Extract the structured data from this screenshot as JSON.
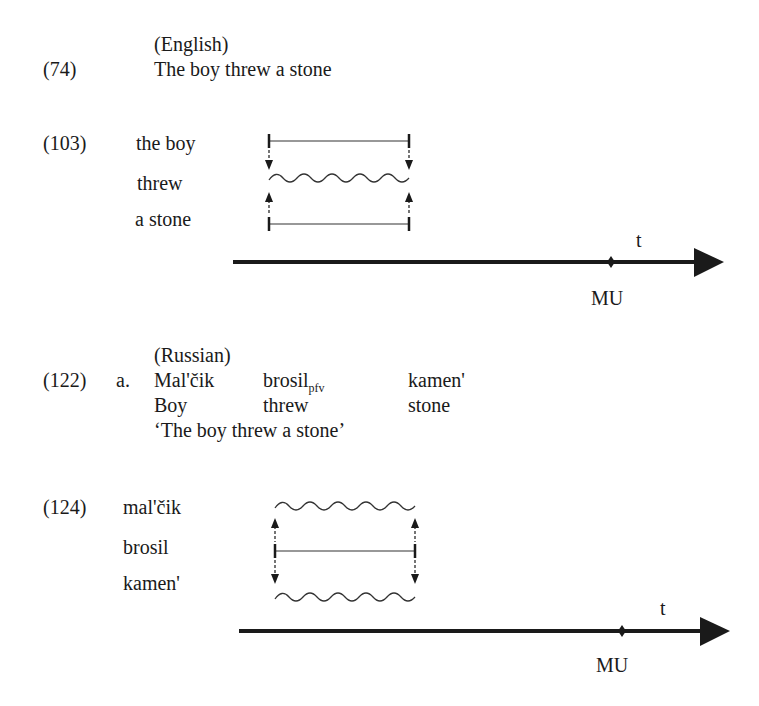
{
  "english": {
    "language": "(English)",
    "example_number": "(74)",
    "sentence": "The boy threw a stone",
    "diagram": {
      "number": "(103)",
      "rows": [
        "the boy",
        "threw",
        "a stone"
      ],
      "row_shapes": [
        "bounded",
        "wavy",
        "bounded"
      ],
      "arrows": "outer rows point toward middle row",
      "axis_label": "t",
      "reference_point": "MU"
    }
  },
  "russian": {
    "language": "(Russian)",
    "example_number": "(122)",
    "sub_label": "a.",
    "gloss": {
      "words": [
        "Mal'čik",
        "brosil",
        "kamen'"
      ],
      "brosil_subscript": "pfv",
      "glosses": [
        "Boy",
        "threw",
        "stone"
      ],
      "translation": "‘The boy threw a stone’"
    },
    "diagram": {
      "number": "(124)",
      "rows": [
        "mal'čik",
        "brosil",
        "kamen'"
      ],
      "row_shapes": [
        "wavy",
        "bounded",
        "wavy"
      ],
      "arrows": "middle row points toward outer rows",
      "axis_label": "t",
      "reference_point": "MU"
    }
  }
}
